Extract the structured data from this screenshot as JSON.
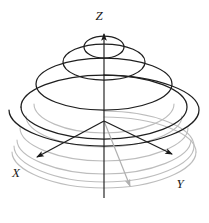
{
  "figure": {
    "type": "3d-line-diagram",
    "background_color": "#ffffff",
    "canvas": {
      "width": 209,
      "height": 223
    }
  },
  "colors": {
    "primary_stroke": "#1a1a1a",
    "secondary_stroke": "#b0b0b0",
    "faint_stroke": "#cccccc",
    "label_color": "#1a1a1a",
    "background": "#ffffff"
  },
  "axes": {
    "origin": {
      "x": 104,
      "y": 121
    },
    "items": [
      {
        "name": "z-axis",
        "label": "Z",
        "label_position": {
          "x": 99,
          "y": 16
        },
        "direction": "up",
        "arrowhead": true,
        "start": {
          "x": 104,
          "y": 196
        },
        "end": {
          "x": 104,
          "y": 32
        },
        "color": "#1a1a1a"
      },
      {
        "name": "x-axis",
        "label": "X",
        "label_position": {
          "x": 12,
          "y": 174
        },
        "direction": "down-left",
        "arrowhead": true,
        "start": {
          "x": 104,
          "y": 121
        },
        "end": {
          "x": 36,
          "y": 158
        },
        "color": "#1a1a1a"
      },
      {
        "name": "y-axis",
        "label": "Y",
        "label_position": {
          "x": 175,
          "y": 185
        },
        "direction": "down-right",
        "arrowhead": true,
        "start": {
          "x": 104,
          "y": 121
        },
        "end": {
          "x": 173,
          "y": 155
        },
        "color": "#1a1a1a"
      }
    ]
  },
  "spiral": {
    "name": "conical-spiral",
    "description": "Helix whose radius shrinks as Z increases, converging to a point on the Z axis",
    "turns_visible": 4,
    "apex": {
      "x": 104,
      "y": 36
    },
    "base_radius_x": 92,
    "base_radius_y": 26,
    "color_upper": "#1a1a1a",
    "color_lower": "#b0b0b0"
  },
  "radius_vector": {
    "name": "radius-vector",
    "label": "",
    "color": "#b0b0b0",
    "arrowhead": true,
    "start": {
      "x": 104,
      "y": 121
    },
    "end": {
      "x": 130,
      "y": 188
    }
  },
  "labels": {
    "z": "Z",
    "x": "X",
    "y": "Y"
  }
}
